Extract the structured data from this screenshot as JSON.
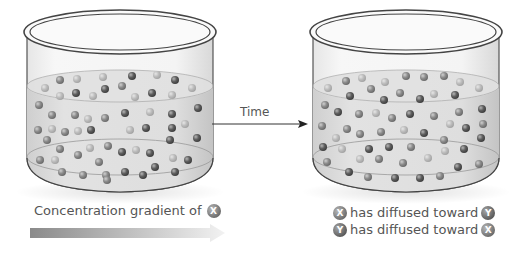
{
  "diagram": {
    "arrow_label": "Time",
    "left_caption": {
      "text": "Concentration gradient of",
      "molecule": "X"
    },
    "right_captions": [
      {
        "from": "X",
        "text": "has diffused toward",
        "to": "Y"
      },
      {
        "from": "Y",
        "text": "has diffused toward",
        "to": "X"
      }
    ],
    "beakers": [
      {
        "name": "before",
        "state": "X concentrated; gradient present"
      },
      {
        "name": "after",
        "state": "X and Y evenly mixed"
      }
    ],
    "colors": {
      "beaker_outline": "#4a4a4a",
      "liquid": "#d9d9d9",
      "dark_molecule": "#5a5a5a",
      "light_molecule": "#b0b0b0",
      "gradient_start": "#8a8a8a",
      "gradient_end": "#f0f0f0"
    }
  }
}
